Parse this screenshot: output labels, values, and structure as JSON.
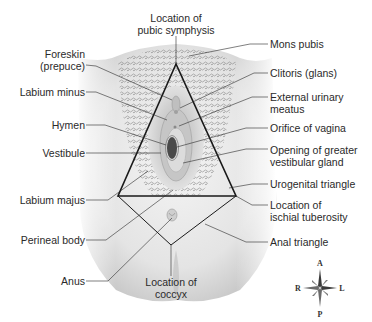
{
  "figure": {
    "labels_left": [
      {
        "id": "foreskin",
        "lines": [
          "Foreskin",
          "(prepuce)"
        ]
      },
      {
        "id": "labium-minus",
        "lines": [
          "Labium minus"
        ]
      },
      {
        "id": "hymen",
        "lines": [
          "Hymen"
        ]
      },
      {
        "id": "vestibule",
        "lines": [
          "Vestibule"
        ]
      },
      {
        "id": "labium-majus",
        "lines": [
          "Labium majus"
        ]
      },
      {
        "id": "perineal-body",
        "lines": [
          "Perineal body"
        ]
      },
      {
        "id": "anus",
        "lines": [
          "Anus"
        ]
      }
    ],
    "labels_top": [
      {
        "id": "pubic-symphysis",
        "lines": [
          "Location of",
          "pubic symphysis"
        ]
      }
    ],
    "labels_bottom": [
      {
        "id": "coccyx",
        "lines": [
          "Location of",
          "coccyx"
        ]
      }
    ],
    "labels_right": [
      {
        "id": "mons-pubis",
        "lines": [
          "Mons pubis"
        ]
      },
      {
        "id": "clitoris",
        "lines": [
          "Clitoris (glans)"
        ]
      },
      {
        "id": "urinary-meatus",
        "lines": [
          "External urinary",
          "meatus"
        ]
      },
      {
        "id": "orifice-vagina",
        "lines": [
          "Orifice of vagina"
        ]
      },
      {
        "id": "greater-vestibular",
        "lines": [
          "Opening of greater",
          "vestibular gland"
        ]
      },
      {
        "id": "urogenital-triangle",
        "lines": [
          "Urogenital triangle"
        ]
      },
      {
        "id": "ischial-tuberosity",
        "lines": [
          "Location of",
          "ischial tuberosity"
        ]
      },
      {
        "id": "anal-triangle",
        "lines": [
          "Anal triangle"
        ]
      }
    ],
    "compass": {
      "anterior": "A",
      "posterior": "P",
      "right": "R",
      "left": "L"
    },
    "colors": {
      "line": "#2a2a2a",
      "triangle": "#1a1a1a",
      "skin_light": "#f2f2f2",
      "skin_mid": "#d4d4d4",
      "skin_dark": "#9a9a9a",
      "hair": "#6a6a6a",
      "orifice": "#4a4a4a"
    }
  }
}
